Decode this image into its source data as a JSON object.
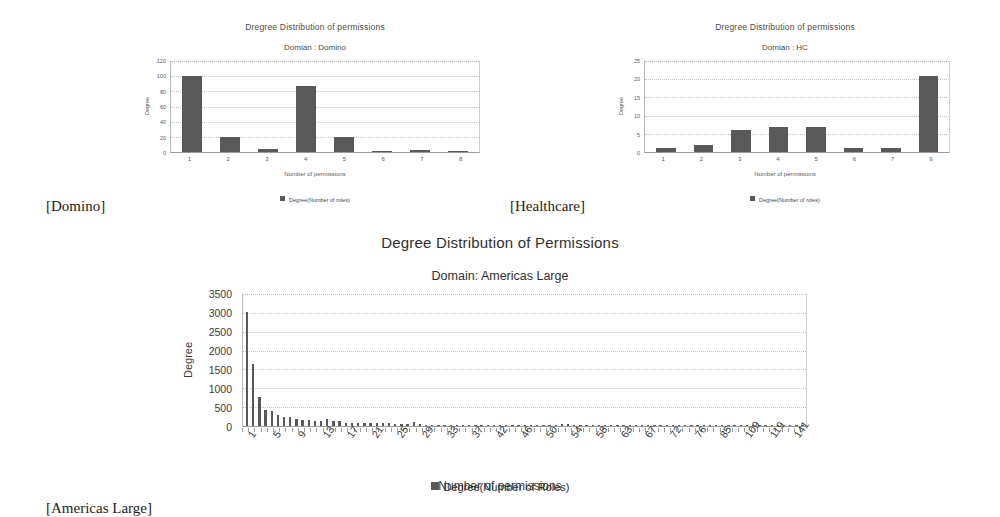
{
  "figure": {
    "captions": [
      {
        "id": "domino",
        "text": "[Domino]"
      },
      {
        "id": "healthcare",
        "text": "[Healthcare]"
      },
      {
        "id": "americas-large",
        "text": "[Americas Large]"
      }
    ]
  },
  "colors": {
    "bar": "#595959",
    "grid": "#c3c3c3",
    "axis": "#9a9a9a",
    "text": "#4a4a4a",
    "background": "#ffffff"
  },
  "chart_data": [
    {
      "id": "domino",
      "type": "bar",
      "title": "Dregree Distribution of permissions",
      "subtitle": "Domian : Domino",
      "xlabel": "Number of permissions",
      "ylabel": "Degree",
      "legend": [
        "Degree(Number of roles)"
      ],
      "legend_position": "bottom",
      "grid": true,
      "ylim": [
        0,
        120
      ],
      "yticks": [
        0,
        20,
        40,
        60,
        80,
        100,
        120
      ],
      "categories": [
        "1",
        "2",
        "3",
        "4",
        "5",
        "6",
        "7",
        "8"
      ],
      "values": [
        100,
        20,
        4,
        87,
        20,
        1,
        2,
        1
      ]
    },
    {
      "id": "healthcare",
      "type": "bar",
      "title": "Dregree Distribution of permissions",
      "subtitle": "Domian : HC",
      "xlabel": "Number of permissions",
      "ylabel": "Degree",
      "legend": [
        "Degree(Number of roles)"
      ],
      "legend_position": "bottom",
      "grid": true,
      "ylim": [
        0,
        25
      ],
      "yticks": [
        0,
        5,
        10,
        15,
        20,
        25
      ],
      "categories": [
        "1",
        "2",
        "3",
        "4",
        "5",
        "6",
        "7",
        "9"
      ],
      "values": [
        1,
        2,
        6,
        7,
        7,
        1,
        1,
        21
      ]
    },
    {
      "id": "americas-large",
      "type": "bar",
      "title": "Degree Distribution of Permissions",
      "subtitle": "Domain: Americas Large",
      "xlabel": "Number of permissions",
      "ylabel": "Degree",
      "legend": [
        "Degree(Number of Roles)"
      ],
      "legend_position": "bottom",
      "grid": true,
      "ylim": [
        0,
        3500
      ],
      "yticks": [
        0,
        500,
        1000,
        1500,
        2000,
        2500,
        3000,
        3500
      ],
      "xticklabels": [
        "1",
        "5",
        "9",
        "13",
        "17",
        "21",
        "25",
        "29",
        "33",
        "37",
        "42",
        "46",
        "50",
        "54",
        "58",
        "63",
        "67",
        "72",
        "76",
        "85",
        "109",
        "119",
        "141"
      ],
      "xtick_every": 4,
      "categories": [
        "1",
        "2",
        "3",
        "4",
        "5",
        "6",
        "7",
        "8",
        "9",
        "10",
        "11",
        "12",
        "13",
        "14",
        "15",
        "16",
        "17",
        "18",
        "19",
        "20",
        "21",
        "22",
        "23",
        "24",
        "25",
        "26",
        "27",
        "28",
        "29",
        "30",
        "31",
        "32",
        "33",
        "34",
        "35",
        "36",
        "37",
        "38",
        "39",
        "40",
        "41",
        "42",
        "43",
        "44",
        "45",
        "46",
        "47",
        "48",
        "49",
        "50",
        "51",
        "52",
        "53",
        "54",
        "55",
        "56",
        "57",
        "58",
        "59",
        "60",
        "61",
        "62",
        "63",
        "64",
        "65",
        "66",
        "67",
        "68",
        "69",
        "70",
        "71",
        "72",
        "73",
        "74",
        "75",
        "76",
        "77",
        "78",
        "79",
        "80",
        "81",
        "82",
        "83",
        "84",
        "85",
        "86",
        "87",
        "88",
        "89",
        "90",
        "91"
      ],
      "values": [
        3030,
        1640,
        770,
        430,
        400,
        300,
        250,
        250,
        175,
        165,
        155,
        140,
        135,
        180,
        130,
        125,
        85,
        90,
        85,
        85,
        80,
        75,
        70,
        80,
        65,
        60,
        65,
        95,
        55,
        35,
        30,
        30,
        28,
        30,
        25,
        25,
        25,
        25,
        22,
        22,
        20,
        20,
        20,
        18,
        18,
        20,
        20,
        18,
        18,
        16,
        16,
        60,
        55,
        30,
        16,
        14,
        14,
        14,
        12,
        12,
        12,
        12,
        12,
        10,
        10,
        10,
        10,
        10,
        30,
        10,
        10,
        10,
        8,
        8,
        8,
        8,
        8,
        8,
        8,
        8,
        20,
        8,
        8,
        8,
        8,
        8,
        8,
        8,
        6,
        6,
        6
      ]
    }
  ]
}
